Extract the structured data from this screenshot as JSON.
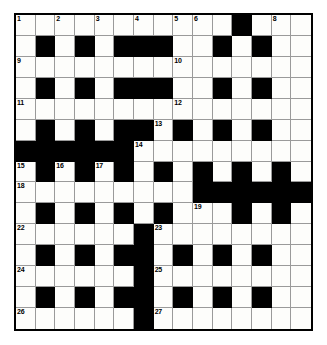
{
  "puzzle": {
    "title": "Crossword Grid",
    "rows": 15,
    "cols": 15,
    "colors": {
      "block": "#000000",
      "open": "#fdfdfb",
      "gridline": "#9a9a9a",
      "border": "#000000",
      "number_text": "#000000",
      "page_background": "#ffffff"
    },
    "grid": [
      "...........#...",
      ".#.#.###..#.#..",
      "...............",
      ".#.#.###..#.#..",
      "...............",
      ".#.#.##.#.#.#..",
      "######.........",
      ".#.#.#.#.#.#.#.",
      ".........######",
      ".#.#.#.#...#.#.",
      "......#........",
      ".#.#.##.#.#.#..",
      "......#........",
      ".#.#.##.#.#.#..",
      "......#........"
    ],
    "numbers": [
      {
        "n": 1,
        "row": 0,
        "col": 0
      },
      {
        "n": 2,
        "row": 0,
        "col": 2
      },
      {
        "n": 3,
        "row": 0,
        "col": 4
      },
      {
        "n": 4,
        "row": 0,
        "col": 6
      },
      {
        "n": 5,
        "row": 0,
        "col": 8
      },
      {
        "n": 6,
        "row": 0,
        "col": 9
      },
      {
        "n": 7,
        "row": 0,
        "col": 11
      },
      {
        "n": 8,
        "row": 0,
        "col": 13
      },
      {
        "n": 9,
        "row": 2,
        "col": 0
      },
      {
        "n": 10,
        "row": 2,
        "col": 8
      },
      {
        "n": 11,
        "row": 4,
        "col": 0
      },
      {
        "n": 12,
        "row": 4,
        "col": 8
      },
      {
        "n": 13,
        "row": 5,
        "col": 7
      },
      {
        "n": 14,
        "row": 6,
        "col": 6
      },
      {
        "n": 15,
        "row": 7,
        "col": 0
      },
      {
        "n": 16,
        "row": 7,
        "col": 2
      },
      {
        "n": 17,
        "row": 7,
        "col": 4
      },
      {
        "n": 18,
        "row": 8,
        "col": 0
      },
      {
        "n": 19,
        "row": 9,
        "col": 9
      },
      {
        "n": 20,
        "row": 9,
        "col": 11
      },
      {
        "n": 21,
        "row": 9,
        "col": 13
      },
      {
        "n": 22,
        "row": 10,
        "col": 0
      },
      {
        "n": 23,
        "row": 10,
        "col": 7
      },
      {
        "n": 24,
        "row": 12,
        "col": 0
      },
      {
        "n": 25,
        "row": 12,
        "col": 7
      },
      {
        "n": 26,
        "row": 14,
        "col": 0
      },
      {
        "n": 27,
        "row": 14,
        "col": 7
      }
    ]
  }
}
